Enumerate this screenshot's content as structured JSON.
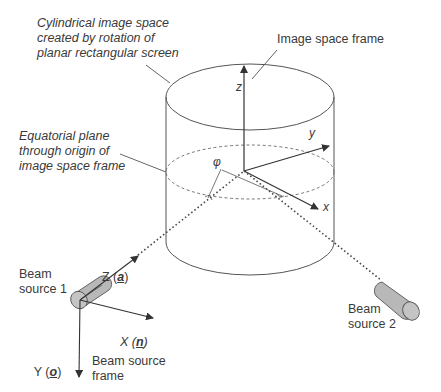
{
  "annotations": {
    "cylindrical_space": "Cylindrical image space\ncreated by rotation of\nplanar rectangular screen",
    "image_space_frame": "Image space frame",
    "equatorial_plane": "Equatorial plane\nthrough origin of\nimage space frame",
    "beam_source_1": "Beam\nsource 1",
    "beam_source_2": "Beam\nsource 2",
    "beam_source_frame": "Beam source\nframe"
  },
  "image_axes": {
    "z": "z",
    "y": "y",
    "x": "x",
    "angle": "φ"
  },
  "beam_axes": {
    "Z": {
      "label": "Z",
      "vector": "a"
    },
    "X": {
      "label": "X",
      "vector": "n"
    },
    "Y": {
      "label": "Y",
      "vector": "o"
    }
  },
  "colors": {
    "line": "#4a4a4a",
    "beam_fill": "#b8b8b8",
    "text": "#3a3a3a"
  }
}
